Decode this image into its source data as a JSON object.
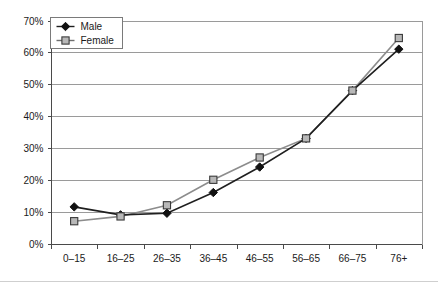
{
  "chart_data": {
    "type": "line",
    "title": "",
    "subtitle": "",
    "xlabel": "",
    "ylabel": "",
    "categories": [
      "0–15",
      "16–25",
      "26–35",
      "36–45",
      "46–55",
      "56–65",
      "66–75",
      "76+"
    ],
    "series": [
      {
        "name": "Male",
        "marker": "filled-diamond",
        "color": "#1f1f1f",
        "values": [
          11.5,
          9,
          9.5,
          16,
          24,
          33,
          48,
          61
        ]
      },
      {
        "name": "Female",
        "marker": "open-square",
        "color": "#8c8c8c",
        "values": [
          7,
          8.5,
          12,
          20,
          27,
          33,
          48,
          64.5
        ]
      }
    ],
    "ylim": [
      0,
      70
    ],
    "ytick_values": [
      0,
      10,
      20,
      30,
      40,
      50,
      60,
      70
    ],
    "ytick_labels": [
      "0%",
      "10%",
      "20%",
      "30%",
      "40%",
      "50%",
      "60%",
      "70%"
    ],
    "grid": "horizontal",
    "legend_position": "top-left",
    "value_suffix": "%"
  },
  "legend": {
    "entries": [
      {
        "label": "Male"
      },
      {
        "label": "Female"
      }
    ]
  },
  "colors": {
    "male": "#1f1f1f",
    "female": "#8c8c8c",
    "gridline": "#9a9a9a",
    "axis": "#4a4a4a",
    "text": "#1a1a1a",
    "background": "#ffffff"
  }
}
